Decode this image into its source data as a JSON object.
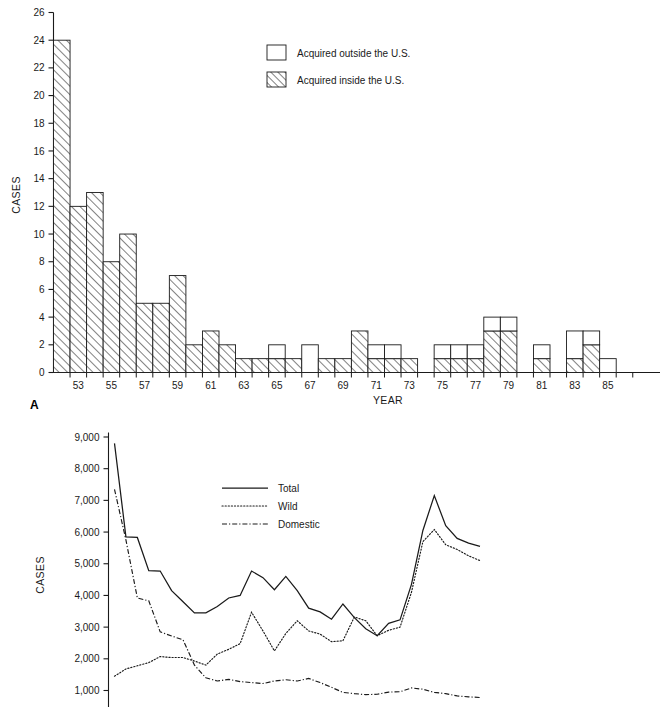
{
  "figure": {
    "panel_a_label": "A",
    "background": "#ffffff",
    "ink": "#1a1a1a"
  },
  "chart_data": [
    {
      "id": "panel-a",
      "type": "bar",
      "stacked": true,
      "title": "",
      "xlabel": "YEAR",
      "ylabel": "CASES",
      "ylim": [
        0,
        26
      ],
      "ytick_step": 2,
      "yticks": [
        "0",
        "2",
        "4",
        "6",
        "8",
        "10",
        "12",
        "14",
        "16",
        "18",
        "20",
        "22",
        "24",
        "26"
      ],
      "grid": false,
      "legend_position": "top-center",
      "xtick_labels": [
        "53",
        "55",
        "57",
        "59",
        "61",
        "63",
        "65",
        "67",
        "69",
        "71",
        "73",
        "75",
        "77",
        "79",
        "81",
        "83",
        "85"
      ],
      "categories": [
        "52",
        "53",
        "54",
        "55",
        "56",
        "57",
        "58",
        "59",
        "60",
        "61",
        "62",
        "63",
        "64",
        "65",
        "66",
        "67",
        "68",
        "69",
        "70",
        "71",
        "72",
        "73",
        "74",
        "75",
        "76",
        "77",
        "78",
        "79",
        "80",
        "81",
        "82",
        "83",
        "84",
        "85",
        "86"
      ],
      "series": [
        {
          "name": "Acquired inside the U.S.",
          "pattern": "hatched",
          "values": [
            24,
            12,
            13,
            8,
            10,
            5,
            5,
            7,
            2,
            3,
            2,
            1,
            1,
            1,
            1,
            0,
            1,
            1,
            3,
            1,
            1,
            1,
            0,
            1,
            1,
            1,
            3,
            3,
            0,
            1,
            0,
            1,
            2,
            0,
            0
          ]
        },
        {
          "name": "Acquired outside the U.S.",
          "pattern": "white",
          "values": [
            0,
            0,
            0,
            0,
            0,
            0,
            0,
            0,
            0,
            0,
            0,
            0,
            0,
            1,
            0,
            2,
            0,
            0,
            0,
            1,
            1,
            0,
            0,
            1,
            1,
            1,
            1,
            1,
            0,
            1,
            0,
            2,
            1,
            1,
            0
          ]
        }
      ],
      "totals": [
        24,
        12,
        13,
        8,
        10,
        5,
        5,
        7,
        2,
        3,
        2,
        1,
        1,
        2,
        1,
        2,
        1,
        1,
        3,
        2,
        2,
        1,
        0,
        2,
        2,
        2,
        4,
        4,
        0,
        2,
        0,
        3,
        3,
        1,
        0
      ],
      "legend": [
        {
          "label": "Acquired outside the U.S.",
          "swatch": "white"
        },
        {
          "label": "Acquired inside the U.S.",
          "swatch": "hatched"
        }
      ]
    },
    {
      "id": "panel-b",
      "type": "line",
      "title": "",
      "xlabel": "",
      "ylabel": "CASES",
      "ylim": [
        700,
        9000
      ],
      "ytick_step": 1000,
      "yticks": [
        "1,000",
        "2,000",
        "3,000",
        "4,000",
        "5,000",
        "6,000",
        "7,000",
        "8,000",
        "9,000"
      ],
      "grid": false,
      "legend_position": "upper-center",
      "x": [
        0,
        1,
        2,
        3,
        4,
        5,
        6,
        7,
        8,
        9,
        10,
        11,
        12,
        13,
        14,
        15,
        16,
        17,
        18,
        19,
        20,
        21,
        22,
        23,
        24,
        25,
        26,
        27,
        28,
        29,
        30,
        31,
        32
      ],
      "series": [
        {
          "name": "Total",
          "style": "solid",
          "values": [
            8800,
            5850,
            5830,
            4780,
            4770,
            4150,
            3800,
            3450,
            3450,
            3650,
            3920,
            4000,
            4770,
            4560,
            4180,
            4600,
            4150,
            3600,
            3480,
            3250,
            3730,
            3300,
            2950,
            2730,
            3120,
            3230,
            4350,
            6050,
            7150,
            6200,
            5800,
            5650,
            5550
          ]
        },
        {
          "name": "Wild",
          "style": "dotted",
          "values": [
            1450,
            1680,
            1780,
            1880,
            2070,
            2040,
            2040,
            1930,
            1800,
            2150,
            2300,
            2480,
            3470,
            2880,
            2250,
            2800,
            3200,
            2880,
            2780,
            2540,
            2570,
            3320,
            3200,
            2730,
            2900,
            3000,
            4100,
            5700,
            6080,
            5600,
            5450,
            5250,
            5100
          ]
        },
        {
          "name": "Domestic",
          "style": "dashdot",
          "values": [
            7350,
            5750,
            3920,
            3830,
            2850,
            2720,
            2600,
            1800,
            1400,
            1300,
            1350,
            1280,
            1250,
            1220,
            1300,
            1340,
            1300,
            1380,
            1250,
            1100,
            940,
            900,
            870,
            880,
            950,
            960,
            1080,
            1040,
            940,
            900,
            830,
            800,
            780
          ]
        }
      ],
      "legend": [
        {
          "label": "Total",
          "style": "solid"
        },
        {
          "label": "Wild",
          "style": "dotted"
        },
        {
          "label": "Domestic",
          "style": "dashdot"
        }
      ]
    }
  ]
}
